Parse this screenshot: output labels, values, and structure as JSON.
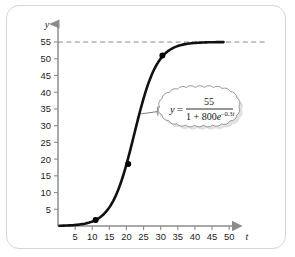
{
  "figure": {
    "name": "logistic-growth-graph",
    "background": "#ffffff",
    "frame_color": "#d6d6d6"
  },
  "axes": {
    "x_name": "t",
    "y_name": "y",
    "x_ticks": [
      "5",
      "10",
      "15",
      "20",
      "25",
      "30",
      "35",
      "40",
      "45",
      "50"
    ],
    "y_ticks": [
      "5",
      "10",
      "15",
      "20",
      "25",
      "30",
      "35",
      "40",
      "45",
      "50",
      "55"
    ]
  },
  "callout": {
    "name": "equation-callout",
    "lhs_variable": "y",
    "equals": "=",
    "numerator": "55",
    "denominator_lead": "1 + 800",
    "denominator_base": "e",
    "denominator_exponent_sign": "–0.3",
    "denominator_exponent_var": "t",
    "full_equation": "y = 55 / (1 + 800e^(-0.3t))"
  },
  "chart_data": {
    "type": "line",
    "title": "",
    "xlabel": "t",
    "ylabel": "y",
    "xlim": [
      0,
      52
    ],
    "ylim": [
      0,
      58
    ],
    "grid": false,
    "legend": null,
    "equation": "y = 55/(1 + 800e^(-0.3t))",
    "asymptote": {
      "y": 55,
      "style": "dashed",
      "label": "55"
    },
    "model": {
      "L": 55,
      "a": 800,
      "k": 0.3
    },
    "xticks": [
      5,
      10,
      15,
      20,
      25,
      30,
      35,
      40,
      45,
      50
    ],
    "yticks": [
      5,
      10,
      15,
      20,
      25,
      30,
      35,
      40,
      45,
      50,
      55
    ],
    "series": [
      {
        "name": "logistic-curve",
        "color": "#111111",
        "x": [
          1,
          3,
          5,
          7,
          9,
          11,
          13,
          15,
          17,
          19,
          20,
          21,
          22,
          23,
          24,
          25,
          26,
          27,
          28,
          30,
          32,
          35,
          40,
          45,
          48
        ],
        "y": [
          0.09,
          0.17,
          0.3,
          0.55,
          1.0,
          1.81,
          3.25,
          5.72,
          9.78,
          15.8,
          19.5,
          23.5,
          27.7,
          31.8,
          35.6,
          39.0,
          41.9,
          44.2,
          46.1,
          48.9,
          50.7,
          52.3,
          53.8,
          54.5,
          54.7
        ]
      }
    ],
    "points": [
      {
        "name": "point-a",
        "x": 11,
        "y": 1.8
      },
      {
        "name": "point-b",
        "x": 20.5,
        "y": 18.5
      },
      {
        "name": "point-c",
        "x": 30.5,
        "y": 51.0
      }
    ],
    "leader_anchor": {
      "x": 24.3,
      "y": 33.5
    }
  }
}
